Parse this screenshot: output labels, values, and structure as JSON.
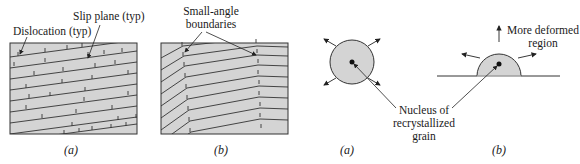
{
  "figure_left": {
    "panel_a": {
      "callouts": {
        "dislocation": "Dislocation (typ)",
        "slip_plane": "Slip plane (typ)"
      },
      "caption": "(a)"
    },
    "panel_b": {
      "callouts": {
        "boundaries_line1": "Small-angle",
        "boundaries_line2": "boundaries"
      },
      "caption": "(b)"
    }
  },
  "figure_right": {
    "panel_a": {
      "callout_line1": "Nucleus of",
      "callout_line2": "recrystallized",
      "callout_line3": "grain",
      "caption": "(a)"
    },
    "panel_b": {
      "callout_line1": "More deformed",
      "callout_line2": "region",
      "caption": "(b)"
    }
  },
  "colors": {
    "fill": "#d4d4d4",
    "stroke": "#333333",
    "text": "#1a1a1a"
  }
}
